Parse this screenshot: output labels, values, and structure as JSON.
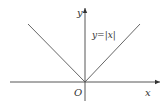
{
  "diagram": {
    "function_label": "y=|x|",
    "x_axis_label": "x",
    "y_axis_label": "y",
    "origin_label": "O",
    "colors": {
      "line": "#555555",
      "axis": "#444444",
      "text": "#333333",
      "background": "#ffffff"
    }
  }
}
